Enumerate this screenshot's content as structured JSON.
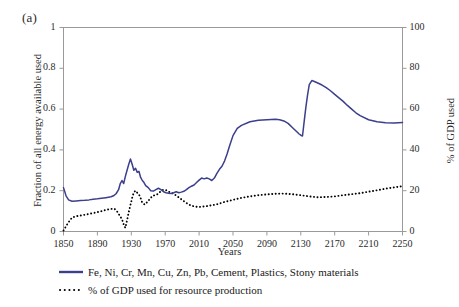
{
  "panel": {
    "label": "(a)"
  },
  "axes": {
    "xlabel": "Years",
    "ylabel_left": "Fraction of all energy available used",
    "ylabel_right": "% of GDP used",
    "xticks": [
      "1850",
      "1890",
      "1930",
      "1970",
      "2010",
      "2050",
      "2090",
      "2130",
      "2170",
      "2210",
      "2250"
    ],
    "yticks_left": [
      "1",
      "0.8",
      "0.6",
      "0.4",
      "0.2",
      "0"
    ],
    "yticks_right": [
      "100",
      "80",
      "60",
      "40",
      "20",
      "0"
    ]
  },
  "legend": {
    "items": [
      {
        "label": "Fe, Ni, Cr, Mn, Cu, Zn, Pb, Cement, Plastics, Stony materials",
        "style": "solid",
        "color": "#3b3f8c"
      },
      {
        "label": "% of GDP used for resource production",
        "style": "dotted",
        "color": "#000000"
      }
    ]
  },
  "colors": {
    "energy_line": "#3b3f8c",
    "gdp_line": "#000000",
    "frame": "#9a9a9a",
    "text": "#2b2b2b"
  },
  "chart_data": {
    "type": "line",
    "title": "",
    "xlabel": "Years",
    "ylabel": "Fraction of all energy available used",
    "ylabel_secondary": "% of GDP used",
    "xlim": [
      1850,
      2250
    ],
    "ylim": [
      0,
      1
    ],
    "ylim_secondary": [
      0,
      100
    ],
    "grid": false,
    "legend_position": "below",
    "series": [
      {
        "name": "Fe, Ni, Cr, Mn, Cu, Zn, Pb, Cement, Plastics, Stony materials",
        "axis": "left",
        "style": "solid",
        "color": "#3b3f8c",
        "x": [
          1850,
          1853,
          1856,
          1860,
          1865,
          1870,
          1875,
          1880,
          1885,
          1890,
          1895,
          1900,
          1903,
          1906,
          1909,
          1912,
          1915,
          1917,
          1919,
          1921,
          1923,
          1925,
          1927,
          1929,
          1931,
          1933,
          1935,
          1937,
          1939,
          1941,
          1943,
          1945,
          1947,
          1950,
          1953,
          1956,
          1959,
          1962,
          1965,
          1968,
          1971,
          1974,
          1977,
          1980,
          1983,
          1986,
          1989,
          1992,
          1995,
          1998,
          2001,
          2004,
          2007,
          2010,
          2013,
          2016,
          2019,
          2022,
          2025,
          2028,
          2031,
          2034,
          2037,
          2040,
          2043,
          2046,
          2050,
          2055,
          2060,
          2070,
          2080,
          2090,
          2100,
          2105,
          2110,
          2115,
          2120,
          2125,
          2128,
          2130,
          2132,
          2134,
          2136,
          2138,
          2140,
          2143,
          2146,
          2150,
          2155,
          2160,
          2165,
          2170,
          2175,
          2180,
          2185,
          2190,
          2195,
          2200,
          2210,
          2220,
          2230,
          2240,
          2250
        ],
        "y": [
          0.215,
          0.175,
          0.155,
          0.148,
          0.15,
          0.152,
          0.153,
          0.155,
          0.158,
          0.16,
          0.163,
          0.166,
          0.168,
          0.17,
          0.175,
          0.185,
          0.205,
          0.235,
          0.25,
          0.235,
          0.27,
          0.3,
          0.33,
          0.355,
          0.33,
          0.3,
          0.31,
          0.29,
          0.295,
          0.265,
          0.25,
          0.24,
          0.225,
          0.215,
          0.2,
          0.198,
          0.205,
          0.212,
          0.205,
          0.195,
          0.19,
          0.188,
          0.186,
          0.19,
          0.195,
          0.19,
          0.193,
          0.197,
          0.205,
          0.215,
          0.222,
          0.228,
          0.24,
          0.252,
          0.262,
          0.258,
          0.262,
          0.258,
          0.25,
          0.262,
          0.285,
          0.305,
          0.32,
          0.345,
          0.38,
          0.42,
          0.47,
          0.505,
          0.52,
          0.538,
          0.545,
          0.548,
          0.55,
          0.548,
          0.542,
          0.53,
          0.51,
          0.49,
          0.478,
          0.472,
          0.468,
          0.54,
          0.61,
          0.67,
          0.72,
          0.74,
          0.735,
          0.728,
          0.718,
          0.705,
          0.69,
          0.672,
          0.655,
          0.638,
          0.618,
          0.6,
          0.582,
          0.568,
          0.548,
          0.538,
          0.533,
          0.532,
          0.534
        ]
      },
      {
        "name": "% of GDP used for resource production",
        "axis": "right",
        "style": "dotted",
        "color": "#000000",
        "x": [
          1850,
          1855,
          1860,
          1865,
          1870,
          1875,
          1880,
          1885,
          1890,
          1895,
          1900,
          1905,
          1910,
          1913,
          1916,
          1919,
          1921,
          1923,
          1925,
          1927,
          1929,
          1931,
          1933,
          1935,
          1937,
          1940,
          1943,
          1946,
          1950,
          1955,
          1960,
          1965,
          1968,
          1971,
          1974,
          1977,
          1980,
          1985,
          1990,
          1995,
          2000,
          2005,
          2010,
          2020,
          2030,
          2040,
          2050,
          2060,
          2070,
          2080,
          2090,
          2100,
          2110,
          2120,
          2130,
          2140,
          2150,
          2160,
          2170,
          2180,
          2190,
          2200,
          2210,
          2220,
          2230,
          2240,
          2250
        ],
        "y": [
          0.5,
          4.0,
          6.8,
          7.5,
          7.8,
          8.2,
          8.6,
          9.0,
          9.5,
          10.0,
          10.6,
          11.0,
          11.2,
          10.0,
          8.0,
          6.0,
          3.5,
          1.8,
          5.5,
          9.5,
          13.0,
          16.5,
          19.2,
          20.0,
          19.0,
          17.5,
          14.0,
          13.2,
          15.0,
          17.5,
          18.0,
          19.8,
          20.5,
          20.3,
          19.5,
          19.0,
          18.5,
          17.0,
          15.5,
          14.0,
          12.8,
          12.2,
          12.0,
          12.5,
          13.2,
          14.5,
          15.5,
          16.5,
          17.2,
          17.8,
          18.2,
          18.5,
          18.6,
          18.3,
          17.8,
          17.2,
          16.8,
          16.9,
          17.2,
          17.8,
          18.3,
          18.8,
          19.5,
          20.2,
          21.0,
          21.6,
          22.2
        ]
      }
    ]
  }
}
